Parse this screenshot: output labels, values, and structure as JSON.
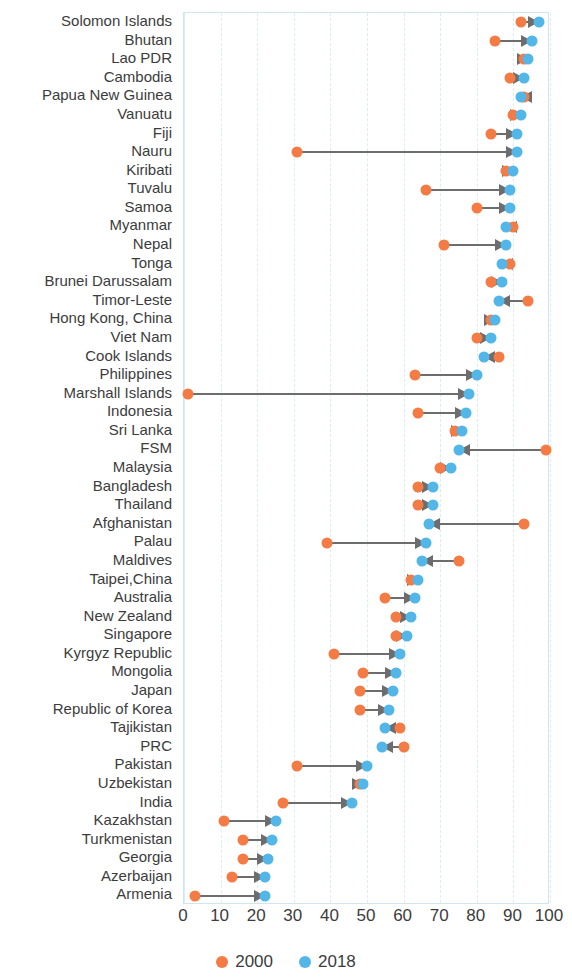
{
  "colors": {
    "series_2000": "#f47b43",
    "series_2018": "#53b6e8",
    "connector": "#6d6d6d",
    "grid": "#d9edf3",
    "text": "#3c3c3c"
  },
  "legend": {
    "items": [
      {
        "label": "2000",
        "color": "#f47b43"
      },
      {
        "label": "2018",
        "color": "#53b6e8"
      }
    ]
  },
  "axis": {
    "ticks": [
      "0",
      "10",
      "20",
      "30",
      "40",
      "50",
      "60",
      "70",
      "80",
      "90",
      "100"
    ],
    "min": 0,
    "max": 100
  },
  "chart_data": {
    "type": "scatter",
    "subtype": "dumbbell-arrow-plot",
    "title": "",
    "xlabel": "",
    "ylabel": "",
    "xlim": [
      0,
      100
    ],
    "grid": true,
    "legend_position": "bottom-center",
    "series": [
      {
        "name": "2000",
        "color": "#f47b43"
      },
      {
        "name": "2018",
        "color": "#53b6e8"
      }
    ],
    "categories": [
      "Solomon Islands",
      "Bhutan",
      "Lao PDR",
      "Cambodia",
      "Papua New Guinea",
      "Vanuatu",
      "Fiji",
      "Nauru",
      "Kiribati",
      "Tuvalu",
      "Samoa",
      "Myanmar",
      "Nepal",
      "Tonga",
      "Brunei Darussalam",
      "Timor-Leste",
      "Hong Kong, China",
      "Viet Nam",
      "Cook Islands",
      "Philippines",
      "Marshall Islands",
      "Indonesia",
      "Sri Lanka",
      "FSM",
      "Malaysia",
      "Bangladesh",
      "Thailand",
      "Afghanistan",
      "Palau",
      "Maldives",
      "Taipei,China",
      "Australia",
      "New Zealand",
      "Singapore",
      "Kyrgyz Republic",
      "Mongolia",
      "Japan",
      "Republic of Korea",
      "Tajikistan",
      "PRC",
      "Pakistan",
      "Uzbekistan",
      "India",
      "Kazakhstan",
      "Turkmenistan",
      "Georgia",
      "Azerbaijan",
      "Armenia"
    ],
    "points": [
      {
        "category": "Solomon Islands",
        "v2000": 92,
        "v2018": 97
      },
      {
        "category": "Bhutan",
        "v2000": 85,
        "v2018": 95
      },
      {
        "category": "Lao PDR",
        "v2000": 93,
        "v2018": 94
      },
      {
        "category": "Cambodia",
        "v2000": 89,
        "v2018": 93
      },
      {
        "category": "Papua New Guinea",
        "v2000": 93,
        "v2018": 92
      },
      {
        "category": "Vanuatu",
        "v2000": 90,
        "v2018": 92
      },
      {
        "category": "Fiji",
        "v2000": 84,
        "v2018": 91
      },
      {
        "category": "Nauru",
        "v2000": 31,
        "v2018": 91
      },
      {
        "category": "Kiribati",
        "v2000": 88,
        "v2018": 90
      },
      {
        "category": "Tuvalu",
        "v2000": 66,
        "v2018": 89
      },
      {
        "category": "Samoa",
        "v2000": 80,
        "v2018": 89
      },
      {
        "category": "Myanmar",
        "v2000": 90,
        "v2018": 88
      },
      {
        "category": "Nepal",
        "v2000": 71,
        "v2018": 88
      },
      {
        "category": "Tonga",
        "v2000": 89,
        "v2018": 87
      },
      {
        "category": "Brunei Darussalam",
        "v2000": 84,
        "v2018": 87
      },
      {
        "category": "Timor-Leste",
        "v2000": 94,
        "v2018": 86
      },
      {
        "category": "Hong Kong, China",
        "v2000": 84,
        "v2018": 85
      },
      {
        "category": "Viet Nam",
        "v2000": 80,
        "v2018": 84
      },
      {
        "category": "Cook Islands",
        "v2000": 86,
        "v2018": 82
      },
      {
        "category": "Philippines",
        "v2000": 63,
        "v2018": 80
      },
      {
        "category": "Marshall Islands",
        "v2000": 1,
        "v2018": 78
      },
      {
        "category": "Indonesia",
        "v2000": 64,
        "v2018": 77
      },
      {
        "category": "Sri Lanka",
        "v2000": 74,
        "v2018": 76
      },
      {
        "category": "FSM",
        "v2000": 99,
        "v2018": 75
      },
      {
        "category": "Malaysia",
        "v2000": 70,
        "v2018": 73
      },
      {
        "category": "Bangladesh",
        "v2000": 64,
        "v2018": 68
      },
      {
        "category": "Thailand",
        "v2000": 64,
        "v2018": 68
      },
      {
        "category": "Afghanistan",
        "v2000": 93,
        "v2018": 67
      },
      {
        "category": "Palau",
        "v2000": 39,
        "v2018": 66
      },
      {
        "category": "Maldives",
        "v2000": 75,
        "v2018": 65
      },
      {
        "category": "Taipei,China",
        "v2000": 62,
        "v2018": 64
      },
      {
        "category": "Australia",
        "v2000": 55,
        "v2018": 63
      },
      {
        "category": "New Zealand",
        "v2000": 58,
        "v2018": 62
      },
      {
        "category": "Singapore",
        "v2000": 58,
        "v2018": 61
      },
      {
        "category": "Kyrgyz Republic",
        "v2000": 41,
        "v2018": 59
      },
      {
        "category": "Mongolia",
        "v2000": 49,
        "v2018": 58
      },
      {
        "category": "Japan",
        "v2000": 48,
        "v2018": 57
      },
      {
        "category": "Republic of Korea",
        "v2000": 48,
        "v2018": 56
      },
      {
        "category": "Tajikistan",
        "v2000": 59,
        "v2018": 55
      },
      {
        "category": "PRC",
        "v2000": 60,
        "v2018": 54
      },
      {
        "category": "Pakistan",
        "v2000": 31,
        "v2018": 50
      },
      {
        "category": "Uzbekistan",
        "v2000": 48,
        "v2018": 49
      },
      {
        "category": "India",
        "v2000": 27,
        "v2018": 46
      },
      {
        "category": "Kazakhstan",
        "v2000": 11,
        "v2018": 25
      },
      {
        "category": "Turkmenistan",
        "v2000": 16,
        "v2018": 24
      },
      {
        "category": "Georgia",
        "v2000": 16,
        "v2018": 23
      },
      {
        "category": "Azerbaijan",
        "v2000": 13,
        "v2018": 22
      },
      {
        "category": "Armenia",
        "v2000": 3,
        "v2018": 22
      }
    ]
  }
}
